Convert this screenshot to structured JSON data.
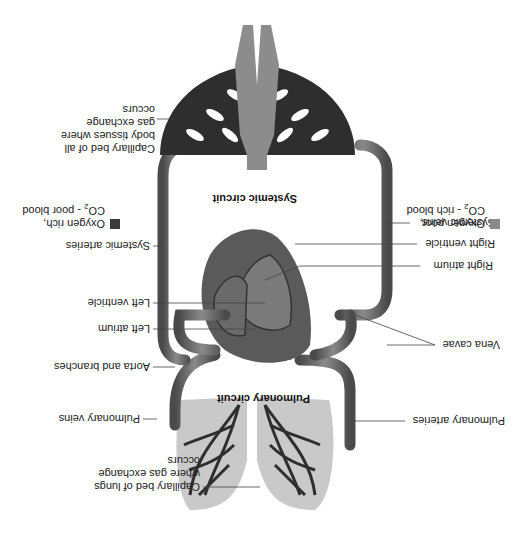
{
  "diagram": {
    "orientation_deg": 180,
    "titles": {
      "systemic": "Systemic circuit",
      "pulmonary": "Pulmonary circuit"
    },
    "labels": {
      "capillary_body": "Capillary bed of all body tissues where gas exchange occurs",
      "systemic_arteries": "Systemic arteries",
      "left_ventricle": "Left ventricle",
      "left_atrium": "Left atrium",
      "aorta": "Aorta and branches",
      "pulmonary_veins": "Pulmonary veins",
      "capillary_lungs": "Capillary bed of lungs where gas exchange occurs",
      "systemic_veins": "Systemic veins",
      "right_ventricle": "Right ventricle",
      "right_atrium": "Right atrium",
      "vena_cavae": "Vena cavae",
      "pulmonary_arteries": "Pulmonary arteries"
    },
    "legend": [
      {
        "line1": "Oxygen rich,",
        "line2_pre": "CO",
        "line2_sub": "2",
        "line2_post": " - poor blood",
        "color": "#3a3a3a"
      },
      {
        "line1": "Oxygen poor,",
        "line2_pre": "CO",
        "line2_sub": "2",
        "line2_post": " - rich blood",
        "color": "#8a8a8a"
      }
    ],
    "colors": {
      "vessel": "#6e6e6e",
      "vessel_dark": "#3c3c3c",
      "heart": "#5a5a5a",
      "body_silhouette": "#8c8c8c",
      "lung_tissue": "#c9c9c9",
      "capillary": "#2e2e2e"
    }
  }
}
